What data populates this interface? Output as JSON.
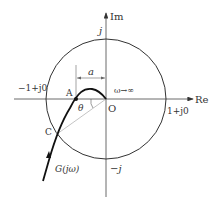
{
  "diagram": {
    "type": "nyquist-plot-unit-circle",
    "axes": {
      "real_label": "Re",
      "imag_label": "Im"
    },
    "points": {
      "origin": "O",
      "A": "A",
      "C": "C"
    },
    "labels": {
      "j_top": "j",
      "neg_j": "−j",
      "minus_one": "−1+j0",
      "plus_one": "1+j0",
      "omega_inf": "ω→∞",
      "a": "a",
      "theta": "θ",
      "curve": "G(jω)"
    },
    "colors": {
      "stroke": "#333333",
      "guide": "#aaaaaa"
    }
  }
}
